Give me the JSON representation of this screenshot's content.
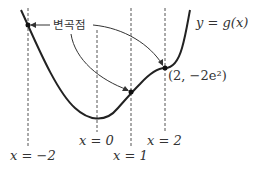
{
  "curve_label": "y = g(x)",
  "annotation": "변곡점",
  "point_label": "(2, −2e²)",
  "vlines": [
    {
      "x": -2,
      "label": "x = −2"
    },
    {
      "x": 0,
      "label": "x = 0"
    },
    {
      "x": 1,
      "label": "x = 1"
    },
    {
      "x": 2,
      "label": "x = 2"
    }
  ],
  "colors": {
    "curve": "#222222",
    "dashed": "#555555",
    "text": "#333333"
  }
}
